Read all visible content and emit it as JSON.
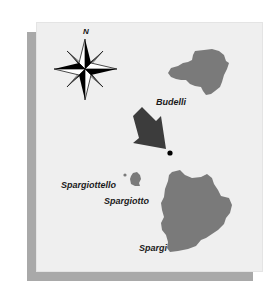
{
  "map": {
    "compass": {
      "north_label": "N"
    },
    "islands": [
      {
        "name": "Budelli"
      },
      {
        "name": "Spargiottello"
      },
      {
        "name": "Spargiotto"
      },
      {
        "name": "Spargi"
      }
    ],
    "marker": {
      "type": "arrow-pointing-to-dot"
    },
    "colors": {
      "background": "#efefef",
      "shadow": "#a9a9a9",
      "land": "#7a7a7a",
      "arrow": "#3c3c3c",
      "text": "#1a1a1a"
    }
  }
}
